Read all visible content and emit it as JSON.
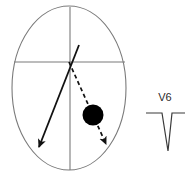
{
  "figure": {
    "background_color": "#ffffff",
    "width": 189,
    "height": 184
  },
  "body_outline": {
    "name": "torso-outline",
    "shape": "oval",
    "stroke_color": "#7a7a7a",
    "stroke_width": 1.1,
    "fill": "none",
    "center_x": 69,
    "center_y": 88,
    "radius_x": 57,
    "radius_y": 82
  },
  "axes": {
    "vertical_line": {
      "name": "vertical-midline",
      "x": 70,
      "y_top": 7,
      "y_bottom": 170,
      "stroke_color": "#7a7a7a",
      "stroke_width": 1.1
    },
    "horizontal_line": {
      "name": "horizontal-midline",
      "y": 62,
      "x_left": 14,
      "x_right": 125,
      "stroke_color": "#7a7a7a",
      "stroke_width": 1.1
    }
  },
  "vectors": [
    {
      "name": "solid-vector-arrow",
      "style": "solid",
      "color": "#111111",
      "stroke_width": 1.8,
      "tail_x": 79,
      "tail_y": 45,
      "tip_x": 38,
      "tip_y": 150,
      "direction": "down-left",
      "arrowhead": "filled"
    },
    {
      "name": "dashed-vector-arrow",
      "style": "dashed",
      "color": "#111111",
      "stroke_width": 1.8,
      "dash_pattern": "4 3",
      "tail_x": 69,
      "tail_y": 62,
      "tip_x": 108,
      "tip_y": 148,
      "direction": "down-right",
      "arrowhead": "filled"
    }
  ],
  "focus_marker": {
    "name": "focus-circle",
    "description": "solid black circle",
    "fill_color": "#000000",
    "center_x": 93,
    "center_y": 115,
    "radius": 10.5
  },
  "ecg": {
    "lead_label": "V6",
    "label_x": 165,
    "label_y": 101,
    "trace_color": "#3a3a3a",
    "stroke_width": 1.2,
    "baseline_y": 113,
    "baseline_x_start": 146,
    "baseline_x_end": 185,
    "complex": {
      "name": "qs-complex",
      "morphology": "deep negative QS deflection",
      "down_start_x": 162,
      "nadir_x": 168,
      "nadir_y": 151,
      "up_end_x": 172
    }
  }
}
